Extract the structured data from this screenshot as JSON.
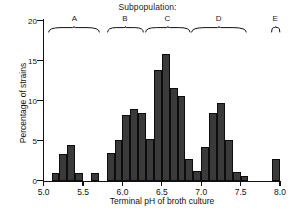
{
  "chart_data": {
    "type": "bar",
    "title": "Subpopulation:",
    "xlabel": "Terminal pH of broth culture",
    "ylabel": "Percentage of strains",
    "xlim": [
      5.0,
      8.0
    ],
    "ylim": [
      0,
      20
    ],
    "bin_width": 0.1,
    "grid": false,
    "legend": "none",
    "xticks": [
      "5.0",
      "5.5",
      "6.0",
      "6.5",
      "7.0",
      "7.5",
      "8.0"
    ],
    "xtick_values": [
      5.0,
      5.5,
      6.0,
      6.5,
      7.0,
      7.5,
      8.0
    ],
    "yticks": [
      "0",
      "5",
      "10",
      "15",
      "20"
    ],
    "ytick_values": [
      0,
      5,
      10,
      15,
      20
    ],
    "x": [
      5.15,
      5.25,
      5.35,
      5.45,
      5.65,
      5.85,
      5.95,
      6.05,
      6.15,
      6.25,
      6.35,
      6.45,
      6.55,
      6.65,
      6.75,
      6.85,
      6.95,
      7.05,
      7.15,
      7.25,
      7.35,
      7.45,
      7.55,
      7.95
    ],
    "bin_left": [
      5.1,
      5.2,
      5.3,
      5.4,
      5.6,
      5.8,
      5.9,
      6.0,
      6.1,
      6.2,
      6.3,
      6.4,
      6.5,
      6.6,
      6.7,
      6.8,
      6.9,
      7.0,
      7.1,
      7.2,
      7.3,
      7.4,
      7.5,
      7.9
    ],
    "values": [
      1.0,
      3.3,
      4.5,
      0.9,
      1.0,
      3.4,
      5.1,
      8.2,
      9.0,
      8.5,
      5.2,
      13.8,
      15.8,
      11.6,
      10.6,
      2.7,
      1.2,
      4.2,
      8.4,
      9.7,
      5.1,
      1.1,
      0.6,
      2.7
    ],
    "categories": [
      "5.1",
      "5.2",
      "5.3",
      "5.4",
      "5.6",
      "5.8",
      "5.9",
      "6.0",
      "6.1",
      "6.2",
      "6.3",
      "6.4",
      "6.5",
      "6.6",
      "6.7",
      "6.8",
      "6.9",
      "7.0",
      "7.1",
      "7.2",
      "7.3",
      "7.4",
      "7.5",
      "7.9"
    ],
    "bar_color": "#3a3a3a",
    "bar_edge_color": "#0d0d0d",
    "annotations": [
      {
        "label": "A",
        "x_start": 5.06,
        "x_end": 5.72,
        "x_center": 5.39
      },
      {
        "label": "B",
        "x_start": 5.8,
        "x_end": 6.27,
        "x_center": 6.03
      },
      {
        "label": "C",
        "x_start": 6.28,
        "x_end": 6.86,
        "x_center": 6.57
      },
      {
        "label": "D",
        "x_start": 6.87,
        "x_end": 7.58,
        "x_center": 7.22
      },
      {
        "label": "E",
        "x_start": 7.88,
        "x_end": 8.0,
        "x_center": 7.94
      }
    ]
  }
}
